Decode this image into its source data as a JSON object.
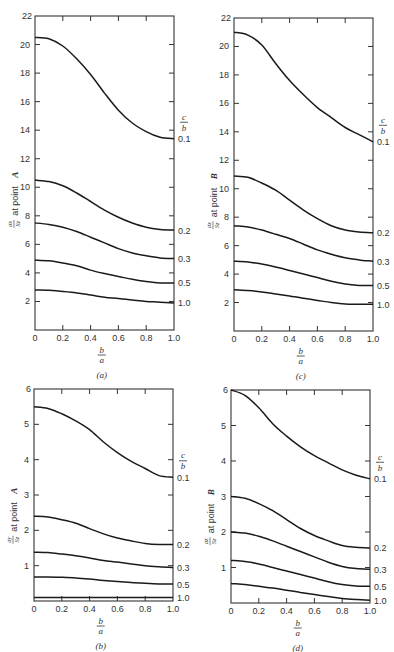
{
  "figure": {
    "panels_order": [
      "a",
      "c",
      "b",
      "d"
    ]
  },
  "chart_data": [
    {
      "id": "a",
      "type": "line",
      "caption": "(a)",
      "title": "",
      "xlabel": "b/a",
      "ylabel": "σx/Sz at point A",
      "ylabel_main": "at point",
      "ylabel_point": "A",
      "legend_title": "c/b",
      "x": [
        0,
        0.1,
        0.2,
        0.3,
        0.4,
        0.5,
        0.6,
        0.7,
        0.8,
        0.9,
        1.0
      ],
      "xticks": [
        "0",
        "0.2",
        "0.4",
        "0.6",
        "0.8",
        "1.0"
      ],
      "yticks": [
        "2",
        "4",
        "6",
        "8",
        "10",
        "12",
        "14",
        "16",
        "18",
        "20",
        "22"
      ],
      "ylim": [
        0,
        22
      ],
      "xlim": [
        0,
        1
      ],
      "grid": false,
      "series": [
        {
          "name": "0.1",
          "values": [
            20.5,
            20.4,
            19.9,
            19.0,
            17.9,
            16.6,
            15.4,
            14.5,
            13.9,
            13.5,
            13.4
          ]
        },
        {
          "name": "0.2",
          "values": [
            10.5,
            10.4,
            10.1,
            9.6,
            9.0,
            8.4,
            7.9,
            7.5,
            7.2,
            7.05,
            7.0
          ]
        },
        {
          "name": "0.3",
          "values": [
            7.5,
            7.4,
            7.2,
            6.9,
            6.5,
            6.1,
            5.7,
            5.4,
            5.2,
            5.05,
            5.0
          ]
        },
        {
          "name": "0.5",
          "values": [
            4.9,
            4.85,
            4.7,
            4.5,
            4.2,
            3.95,
            3.75,
            3.55,
            3.4,
            3.3,
            3.3
          ]
        },
        {
          "name": "1.0",
          "values": [
            2.8,
            2.78,
            2.7,
            2.6,
            2.45,
            2.3,
            2.2,
            2.1,
            2.0,
            1.95,
            1.9
          ]
        }
      ],
      "box": {
        "left": 35,
        "top": 16,
        "right": 174,
        "bottom": 330
      }
    },
    {
      "id": "c",
      "type": "line",
      "caption": "(c)",
      "title": "",
      "xlabel": "b/a",
      "ylabel": "σx/Sz at point B",
      "ylabel_main": "at point",
      "ylabel_point": "B",
      "legend_title": "c/b",
      "x": [
        0,
        0.1,
        0.2,
        0.3,
        0.4,
        0.5,
        0.6,
        0.7,
        0.8,
        0.9,
        1.0
      ],
      "xticks": [
        "0",
        "0.2",
        "0.4",
        "0.6",
        "0.8",
        "1.0"
      ],
      "yticks": [
        "2",
        "4",
        "6",
        "8",
        "10",
        "12",
        "14",
        "16",
        "18",
        "20",
        "22"
      ],
      "ylim": [
        0,
        22
      ],
      "xlim": [
        0,
        1
      ],
      "grid": false,
      "series": [
        {
          "name": "0.1",
          "values": [
            21.0,
            20.8,
            20.1,
            18.8,
            17.6,
            16.6,
            15.7,
            15.0,
            14.3,
            13.8,
            13.3
          ]
        },
        {
          "name": "0.2",
          "values": [
            10.9,
            10.8,
            10.4,
            9.9,
            9.2,
            8.5,
            7.9,
            7.4,
            7.1,
            6.95,
            6.9
          ]
        },
        {
          "name": "0.3",
          "values": [
            7.4,
            7.3,
            7.1,
            6.8,
            6.5,
            6.1,
            5.7,
            5.4,
            5.15,
            5.0,
            4.9
          ]
        },
        {
          "name": "0.5",
          "values": [
            4.9,
            4.85,
            4.7,
            4.5,
            4.25,
            4.0,
            3.75,
            3.5,
            3.3,
            3.2,
            3.2
          ]
        },
        {
          "name": "1.0",
          "values": [
            2.9,
            2.85,
            2.75,
            2.6,
            2.45,
            2.3,
            2.15,
            2.0,
            1.9,
            1.88,
            1.88
          ]
        }
      ],
      "box": {
        "left": 234,
        "top": 18,
        "right": 373,
        "bottom": 331
      }
    },
    {
      "id": "b",
      "type": "line",
      "caption": "(b)",
      "title": "",
      "xlabel": "b/a",
      "ylabel": "σy/Sz at point A",
      "ylabel_main": "at point",
      "ylabel_point": "A",
      "legend_title": "c/b",
      "x": [
        0,
        0.1,
        0.2,
        0.3,
        0.4,
        0.5,
        0.6,
        0.7,
        0.8,
        0.9,
        1.0
      ],
      "xticks": [
        "0",
        "0.2",
        "0.4",
        "0.6",
        "0.8",
        "1.0"
      ],
      "yticks": [
        "1",
        "2",
        "3",
        "4",
        "5",
        "6"
      ],
      "ylim": [
        0,
        6
      ],
      "xlim": [
        0,
        1
      ],
      "grid": false,
      "series": [
        {
          "name": "0.1",
          "values": [
            5.5,
            5.45,
            5.3,
            5.1,
            4.85,
            4.5,
            4.2,
            3.95,
            3.75,
            3.55,
            3.5
          ]
        },
        {
          "name": "0.2",
          "values": [
            2.4,
            2.38,
            2.3,
            2.2,
            2.05,
            1.9,
            1.78,
            1.7,
            1.63,
            1.6,
            1.6
          ]
        },
        {
          "name": "0.3",
          "values": [
            1.38,
            1.37,
            1.33,
            1.28,
            1.22,
            1.15,
            1.1,
            1.05,
            1.0,
            0.97,
            0.95
          ]
        },
        {
          "name": "0.5",
          "values": [
            0.68,
            0.68,
            0.67,
            0.65,
            0.62,
            0.58,
            0.55,
            0.52,
            0.5,
            0.48,
            0.48
          ]
        },
        {
          "name": "1.0",
          "values": [
            0.1,
            0.1,
            0.1,
            0.1,
            0.1,
            0.1,
            0.1,
            0.1,
            0.1,
            0.1,
            0.1
          ]
        }
      ],
      "box": {
        "left": 34,
        "top": 389,
        "right": 173,
        "bottom": 601
      }
    },
    {
      "id": "d",
      "type": "line",
      "caption": "(d)",
      "title": "",
      "xlabel": "b/a",
      "ylabel": "σz/Sz at point B",
      "ylabel_main": "at point",
      "ylabel_point": "B",
      "legend_title": "c/b",
      "x": [
        0,
        0.1,
        0.2,
        0.3,
        0.4,
        0.5,
        0.6,
        0.7,
        0.8,
        0.9,
        1.0
      ],
      "xticks": [
        "0",
        "0.2",
        "0.4",
        "0.6",
        "0.8",
        "1.0"
      ],
      "yticks": [
        "1",
        "2",
        "3",
        "4",
        "5",
        "6"
      ],
      "ylim": [
        0,
        6
      ],
      "xlim": [
        0,
        1
      ],
      "grid": false,
      "series": [
        {
          "name": "0.1",
          "values": [
            6.0,
            5.85,
            5.5,
            5.05,
            4.7,
            4.4,
            4.15,
            3.95,
            3.75,
            3.6,
            3.5
          ]
        },
        {
          "name": "0.2",
          "values": [
            3.0,
            2.95,
            2.8,
            2.6,
            2.35,
            2.1,
            1.9,
            1.75,
            1.62,
            1.57,
            1.55
          ]
        },
        {
          "name": "0.3",
          "values": [
            2.0,
            1.97,
            1.88,
            1.75,
            1.6,
            1.45,
            1.3,
            1.15,
            1.03,
            0.97,
            0.95
          ]
        },
        {
          "name": "0.5",
          "values": [
            1.2,
            1.17,
            1.1,
            1.0,
            0.9,
            0.8,
            0.7,
            0.6,
            0.52,
            0.48,
            0.47
          ]
        },
        {
          "name": "1.0",
          "values": [
            0.55,
            0.52,
            0.47,
            0.42,
            0.36,
            0.3,
            0.24,
            0.18,
            0.13,
            0.1,
            0.08
          ]
        }
      ],
      "box": {
        "left": 231,
        "top": 390,
        "right": 370,
        "bottom": 603
      }
    }
  ]
}
